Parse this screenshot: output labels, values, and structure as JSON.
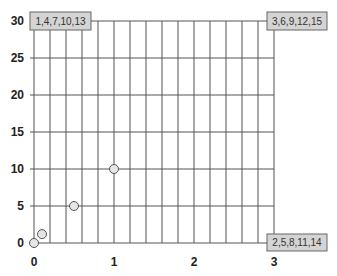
{
  "chart_data": {
    "type": "scatter",
    "title": "",
    "xlabel": "",
    "ylabel": "",
    "xlim": [
      0,
      3
    ],
    "ylim": [
      0,
      30
    ],
    "x_ticks": [
      0,
      1,
      2,
      3
    ],
    "y_ticks": [
      0,
      5,
      10,
      15,
      20,
      25,
      30
    ],
    "x_tick_labels": [
      "0",
      "1",
      "2",
      "3"
    ],
    "y_tick_labels": [
      "0",
      "5",
      "10",
      "15",
      "20",
      "25",
      "30"
    ],
    "grid": {
      "vertical_step": 0.2,
      "horizontal_step": 5,
      "on": true
    },
    "series": [
      {
        "name": "points",
        "marker": "open-circle",
        "points": [
          {
            "x": 0,
            "y": 0
          },
          {
            "x": 0.1,
            "y": 1.2
          },
          {
            "x": 0.5,
            "y": 5
          },
          {
            "x": 1,
            "y": 10
          }
        ]
      }
    ],
    "annotations": [
      {
        "text": "1,4,7,10,13",
        "position": "top-left"
      },
      {
        "text": "3,6,9,12,15",
        "position": "top-right"
      },
      {
        "text": "2,5,8,11,14",
        "position": "bottom-right"
      }
    ]
  },
  "colors": {
    "grid": "#555555",
    "marker_fill": "#e6e6e6",
    "marker_stroke": "#555555",
    "callout_fill": "#d4d4d4",
    "callout_stroke": "#666666",
    "label": "#222222"
  }
}
